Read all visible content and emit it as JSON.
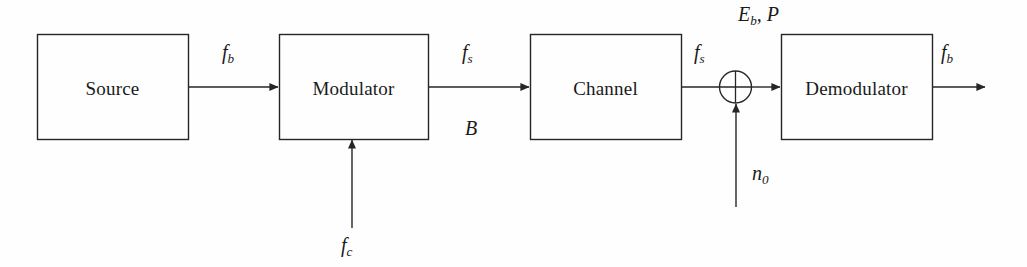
{
  "diagram": {
    "background_color": "#fefefe",
    "line_color": "#262626",
    "text_color": "#1a1a1a",
    "blocks": [
      {
        "id": "source",
        "label": "Source",
        "x": 37,
        "y": 34,
        "w": 151,
        "h": 105
      },
      {
        "id": "modulator",
        "label": "Modulator",
        "x": 279,
        "y": 34,
        "w": 149,
        "h": 105
      },
      {
        "id": "channel",
        "label": "Channel",
        "x": 530,
        "y": 34,
        "w": 151,
        "h": 105
      },
      {
        "id": "demodulator",
        "label": "Demodulator",
        "x": 781,
        "y": 34,
        "w": 151,
        "h": 105
      }
    ],
    "summing_junction": {
      "id": "adder",
      "cx": 735,
      "cy": 87,
      "r": 16,
      "symbol": "plus"
    },
    "signal_labels": [
      {
        "id": "fb-in",
        "base": "f",
        "sub": "b",
        "x": 222,
        "y": 42
      },
      {
        "id": "fs-mod",
        "base": "f",
        "sub": "s",
        "x": 462,
        "y": 42
      },
      {
        "id": "bandwidth",
        "base": "B",
        "sub": "",
        "x": 465,
        "y": 118
      },
      {
        "id": "fs-chan",
        "base": "f",
        "sub": "s",
        "x": 694,
        "y": 42
      },
      {
        "id": "eb-p",
        "base": "E",
        "sub": "b",
        "suffix": ", P",
        "x": 738,
        "y": 4
      },
      {
        "id": "n0",
        "base": "n",
        "sub": "0",
        "x": 752,
        "y": 163
      },
      {
        "id": "fc",
        "base": "f",
        "sub": "c",
        "x": 341,
        "y": 235
      },
      {
        "id": "fb-out",
        "base": "f",
        "sub": "b",
        "x": 941,
        "y": 42
      }
    ],
    "connections": [
      {
        "id": "source-to-modulator",
        "from": "source",
        "to": "modulator",
        "kind": "horizontal-arrow"
      },
      {
        "id": "modulator-to-channel",
        "from": "modulator",
        "to": "channel",
        "kind": "horizontal-arrow"
      },
      {
        "id": "channel-to-adder",
        "from": "channel",
        "to": "adder",
        "kind": "horizontal-line"
      },
      {
        "id": "adder-to-demodulator",
        "from": "adder",
        "to": "demodulator",
        "kind": "horizontal-arrow"
      },
      {
        "id": "demodulator-output",
        "from": "demodulator",
        "to": "output",
        "kind": "horizontal-arrow"
      },
      {
        "id": "carrier-into-modulator",
        "from": "fc",
        "to": "modulator",
        "kind": "vertical-arrow-up"
      },
      {
        "id": "noise-into-adder",
        "from": "n0",
        "to": "adder",
        "kind": "vertical-arrow-up"
      }
    ]
  }
}
